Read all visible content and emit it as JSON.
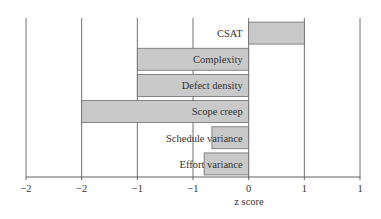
{
  "chart_data": {
    "type": "bar",
    "orientation": "horizontal",
    "title": "",
    "xlabel": "z score",
    "ylabel": "",
    "xlim": [
      -2,
      1
    ],
    "x_ticks": [
      -2,
      -1.5,
      -1,
      -0.5,
      0,
      0.5,
      1
    ],
    "x_tick_labels": [
      "−2",
      "−2",
      "−1",
      "−1",
      "0",
      "1",
      "1"
    ],
    "grid": "vertical",
    "legend": null,
    "categories": [
      "CSAT",
      "Complexity",
      "Defect density",
      "Scope creep",
      "Schedule variance",
      "Effort variance"
    ],
    "values": [
      0.5,
      -1.0,
      -1.0,
      -1.5,
      -0.33,
      -0.4
    ],
    "colors": {
      "bar_fill": "#c9c9c9",
      "bar_stroke": "#6e6e6e",
      "grid": "#707070"
    }
  }
}
